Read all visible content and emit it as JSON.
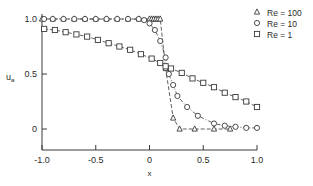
{
  "chart_data": {
    "type": "line",
    "title": "",
    "xlabel": "x",
    "ylabel": "u_a",
    "xlim": [
      -1.0,
      1.0
    ],
    "ylim": [
      -0.2,
      1.0
    ],
    "xticks": [
      -1.0,
      -0.5,
      0,
      0.5,
      1.0
    ],
    "xtick_labels": [
      "-1.0",
      "-0.5",
      "0",
      "0.5",
      "1.0"
    ],
    "yticks": [
      0,
      0.5,
      1.0
    ],
    "ytick_labels": [
      "0",
      "0.5",
      "1.0"
    ],
    "grid": false,
    "legend_position": "upper right",
    "series": [
      {
        "name": "Re = 100",
        "marker": "triangle",
        "line_style": "dashed",
        "x": [
          -1.0,
          -0.9,
          -0.8,
          -0.7,
          -0.6,
          -0.5,
          -0.4,
          -0.3,
          -0.2,
          -0.1,
          0.0,
          0.02,
          0.04,
          0.06,
          0.08,
          0.1,
          0.15,
          0.22,
          0.28,
          0.42,
          0.6,
          0.75
        ],
        "values": [
          1.0,
          1.0,
          1.0,
          1.0,
          1.0,
          1.0,
          1.0,
          1.0,
          1.0,
          1.0,
          1.0,
          1.0,
          1.0,
          1.0,
          1.0,
          1.0,
          0.55,
          0.1,
          0.0,
          0.0,
          0.0,
          0.0
        ]
      },
      {
        "name": "Re = 10",
        "marker": "circle",
        "line_style": "dash-dot",
        "x": [
          -0.98,
          -0.9,
          -0.8,
          -0.7,
          -0.6,
          -0.5,
          -0.4,
          -0.3,
          -0.2,
          -0.1,
          -0.05,
          0.0,
          0.05,
          0.1,
          0.15,
          0.18,
          0.22,
          0.26,
          0.35,
          0.45,
          0.6,
          0.7,
          0.8,
          0.9,
          1.0
        ],
        "values": [
          1.0,
          1.0,
          1.0,
          1.0,
          1.0,
          1.0,
          1.0,
          1.0,
          1.0,
          1.0,
          0.99,
          0.96,
          0.9,
          0.8,
          0.65,
          0.5,
          0.4,
          0.3,
          0.2,
          0.12,
          0.05,
          0.03,
          0.02,
          0.01,
          0.01
        ]
      },
      {
        "name": "Re = 1",
        "marker": "square",
        "line_style": "dashed",
        "x": [
          -0.98,
          -0.88,
          -0.78,
          -0.68,
          -0.58,
          -0.48,
          -0.38,
          -0.28,
          -0.18,
          -0.08,
          0.02,
          0.1,
          0.15,
          0.2,
          0.3,
          0.4,
          0.5,
          0.6,
          0.7,
          0.8,
          0.9,
          1.0
        ],
        "values": [
          0.91,
          0.9,
          0.88,
          0.86,
          0.84,
          0.81,
          0.78,
          0.75,
          0.72,
          0.68,
          0.64,
          0.6,
          0.57,
          0.55,
          0.51,
          0.46,
          0.42,
          0.38,
          0.33,
          0.29,
          0.25,
          0.2
        ]
      }
    ]
  }
}
